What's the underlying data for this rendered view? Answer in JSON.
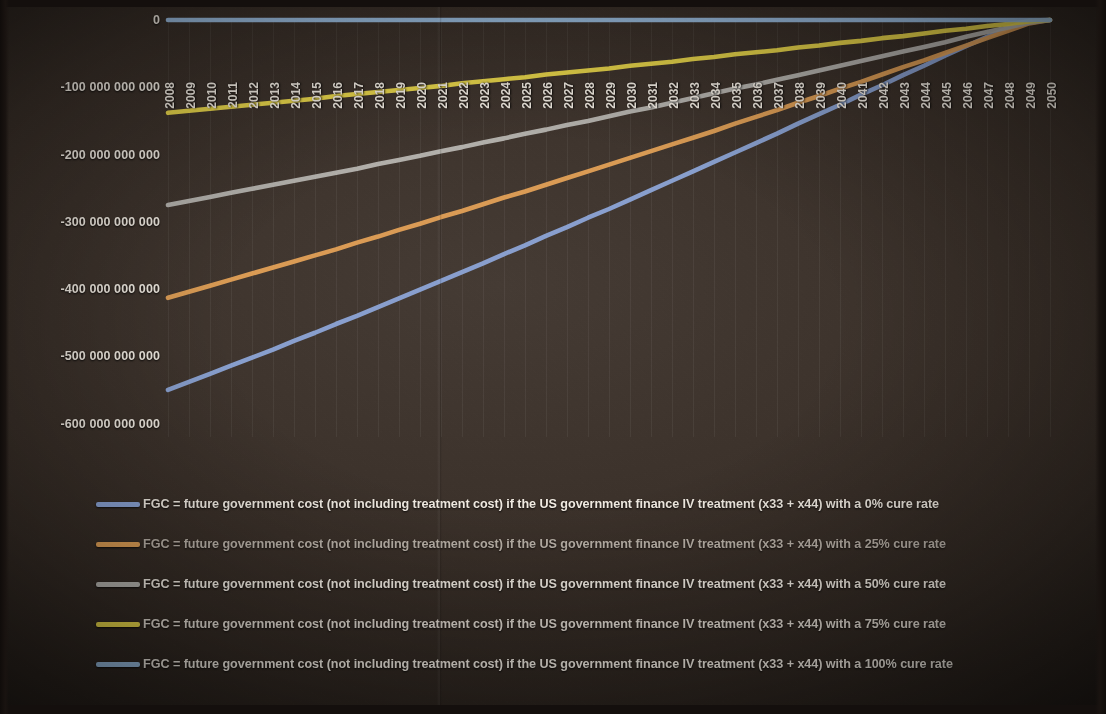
{
  "chart_data": {
    "type": "line",
    "title": "",
    "xlabel": "",
    "ylabel": "",
    "x": [
      2008,
      2009,
      2010,
      2011,
      2012,
      2013,
      2014,
      2015,
      2016,
      2017,
      2018,
      2019,
      2020,
      2021,
      2022,
      2023,
      2024,
      2025,
      2026,
      2027,
      2028,
      2029,
      2030,
      2031,
      2032,
      2033,
      2034,
      2035,
      2036,
      2037,
      2038,
      2039,
      2040,
      2041,
      2042,
      2043,
      2044,
      2045,
      2046,
      2047,
      2048,
      2049,
      2050
    ],
    "xlim": [
      2008,
      2050
    ],
    "ylim": [
      -620000000000,
      0
    ],
    "yticks": [
      0,
      -100000000000,
      -200000000000,
      -300000000000,
      -400000000000,
      -500000000000,
      -600000000000
    ],
    "ytick_labels": [
      "0",
      "-100 000 000 000",
      "-200 000 000 000",
      "-300 000 000 000",
      "-400 000 000 000",
      "-500 000 000 000",
      "-600 000 000 000"
    ],
    "grid": "vertical",
    "legend_position": "below",
    "series": [
      {
        "name": "FGC = future government cost (not including treatment cost) if the US government finance IV treatment (x33 + x44) with a 0% cure rate",
        "color": "#8da6d8",
        "cure_rate": "0%",
        "values": [
          -550000000000,
          -538000000000,
          -526000000000,
          -514000000000,
          -502000000000,
          -490000000000,
          -477000000000,
          -465000000000,
          -452000000000,
          -440000000000,
          -427000000000,
          -414000000000,
          -401000000000,
          -388000000000,
          -375000000000,
          -362000000000,
          -348000000000,
          -335000000000,
          -321000000000,
          -308000000000,
          -294000000000,
          -281000000000,
          -267000000000,
          -253000000000,
          -239000000000,
          -225000000000,
          -211000000000,
          -197000000000,
          -183000000000,
          -169000000000,
          -154000000000,
          -140000000000,
          -126000000000,
          -111000000000,
          -97000000000,
          -82000000000,
          -68000000000,
          -53000000000,
          -39000000000,
          -25000000000,
          -12000000000,
          -1000000000,
          0
        ]
      },
      {
        "name": "FGC = future government cost (not including treatment cost) if the US government finance IV treatment (x33 + x44) with a 25% cure rate",
        "color": "#e3a257",
        "cure_rate": "25%",
        "values": [
          -413000000000,
          -404000000000,
          -395000000000,
          -386000000000,
          -377000000000,
          -368000000000,
          -359000000000,
          -350000000000,
          -341000000000,
          -331000000000,
          -322000000000,
          -312000000000,
          -303000000000,
          -293000000000,
          -284000000000,
          -274000000000,
          -264000000000,
          -255000000000,
          -245000000000,
          -235000000000,
          -225000000000,
          -215000000000,
          -205000000000,
          -195000000000,
          -185000000000,
          -175000000000,
          -165000000000,
          -154000000000,
          -144000000000,
          -134000000000,
          -123000000000,
          -113000000000,
          -102000000000,
          -92000000000,
          -81000000000,
          -70000000000,
          -60000000000,
          -49000000000,
          -38000000000,
          -27000000000,
          -16000000000,
          -5000000000,
          0
        ]
      },
      {
        "name": "FGC = future government cost (not including treatment cost) if the US government finance IV treatment (x33 + x44) with a 50% cure rate",
        "color": "#b9b7b2",
        "cure_rate": "50%",
        "values": [
          -275000000000,
          -269000000000,
          -263000000000,
          -257000000000,
          -251000000000,
          -245000000000,
          -239000000000,
          -233000000000,
          -227000000000,
          -221000000000,
          -214000000000,
          -208000000000,
          -202000000000,
          -195000000000,
          -189000000000,
          -182000000000,
          -176000000000,
          -169000000000,
          -163000000000,
          -156000000000,
          -150000000000,
          -143000000000,
          -136000000000,
          -130000000000,
          -123000000000,
          -116000000000,
          -109000000000,
          -102000000000,
          -96000000000,
          -89000000000,
          -82000000000,
          -75000000000,
          -68000000000,
          -61000000000,
          -54000000000,
          -47000000000,
          -40000000000,
          -33000000000,
          -25000000000,
          -18000000000,
          -11000000000,
          -4000000000,
          0
        ]
      },
      {
        "name": "FGC = future government cost (not including treatment cost) if the US government finance IV treatment (x33 + x44) with a 75% cure rate",
        "color": "#eedb4b",
        "cure_rate": "75%",
        "values": [
          -138000000000,
          -135000000000,
          -132000000000,
          -129000000000,
          -126000000000,
          -123000000000,
          -120000000000,
          -117000000000,
          -113000000000,
          -110000000000,
          -107000000000,
          -104000000000,
          -101000000000,
          -98000000000,
          -94000000000,
          -91000000000,
          -88000000000,
          -85000000000,
          -81000000000,
          -78000000000,
          -75000000000,
          -72000000000,
          -68000000000,
          -65000000000,
          -62000000000,
          -58000000000,
          -55000000000,
          -51000000000,
          -48000000000,
          -45000000000,
          -41000000000,
          -38000000000,
          -34000000000,
          -31000000000,
          -27000000000,
          -24000000000,
          -20000000000,
          -16000000000,
          -13000000000,
          -9000000000,
          -6000000000,
          -2000000000,
          0
        ]
      },
      {
        "name": "FGC = future government cost (not including treatment cost) if the US government finance IV treatment (x33 + x44) with a 100% cure rate",
        "color": "#9fc4e8",
        "cure_rate": "100%",
        "values": [
          0,
          0,
          0,
          0,
          0,
          0,
          0,
          0,
          0,
          0,
          0,
          0,
          0,
          0,
          0,
          0,
          0,
          0,
          0,
          0,
          0,
          0,
          0,
          0,
          0,
          0,
          0,
          0,
          0,
          0,
          0,
          0,
          0,
          0,
          0,
          0,
          0,
          0,
          0,
          0,
          0,
          0,
          0
        ]
      }
    ]
  },
  "legend": {
    "items": [
      {
        "label": "FGC = future government cost (not including treatment cost) if the US government finance IV treatment (x33 + x44) with a 0% cure rate",
        "color": "#8da6d8"
      },
      {
        "label": "FGC = future government cost (not including treatment cost) if the US government finance IV treatment (x33 + x44) with a 25% cure rate",
        "color": "#e3a257"
      },
      {
        "label": "FGC = future government cost (not including treatment cost) if the US government finance IV treatment (x33 + x44) with a 50% cure rate",
        "color": "#b9b7b2"
      },
      {
        "label": "FGC = future government cost (not including treatment cost) if the US government finance IV treatment (x33 + x44) with a 75% cure rate",
        "color": "#eedb4b"
      },
      {
        "label": "FGC = future government cost (not including treatment cost) if the US government finance IV treatment (x33 + x44) with a 100% cure rate",
        "color": "#9fc4e8"
      }
    ]
  }
}
